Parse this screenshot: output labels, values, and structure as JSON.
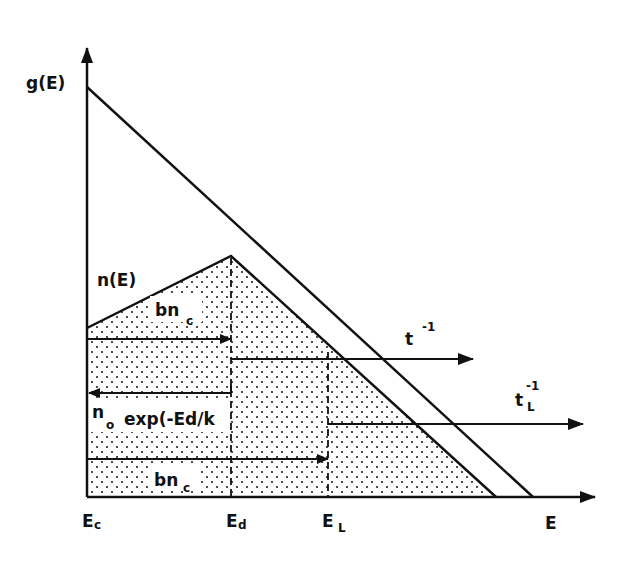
{
  "diagram": {
    "type": "energy level / density of states diagram",
    "y_axis_label": "g(E)",
    "x_axis_label": "E",
    "curves": [
      {
        "name": "g(E)",
        "label": "g(E)",
        "description": "density of states, linear decreasing"
      },
      {
        "name": "n(E)",
        "label": "n(E)",
        "description": "occupied states, rises to E_d then falls (stippled area)"
      }
    ],
    "x_ticks": [
      {
        "label": "E",
        "sub": "c"
      },
      {
        "label": "E",
        "sub": "d"
      },
      {
        "label": "E",
        "sub": "L"
      }
    ],
    "annotations": {
      "n_label": "n(E)",
      "bnc_upper": {
        "main": "bn",
        "sub": "c"
      },
      "bnc_lower": {
        "main": "bn",
        "sub": "c"
      },
      "emission_expr": {
        "pre": "n",
        "sub": "o",
        "post": "exp(-Ed/k"
      },
      "t_inv": {
        "main": "t",
        "sup": "-1"
      },
      "tL_inv": {
        "main": "t",
        "sub": "L",
        "sup": "-1"
      }
    },
    "colors": {
      "stroke": "#111111",
      "dots": "#222222",
      "background": "#ffffff"
    }
  }
}
